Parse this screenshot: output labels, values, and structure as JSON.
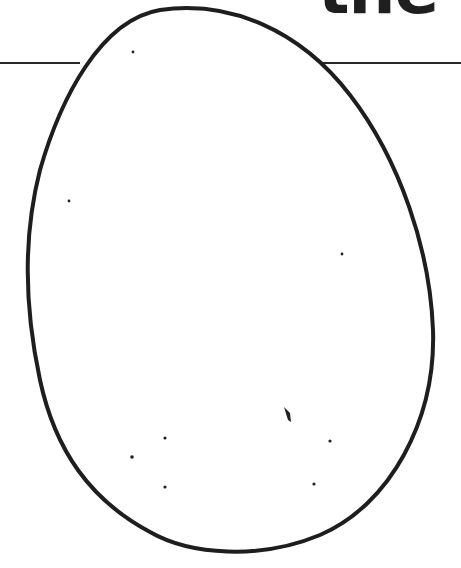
{
  "page": {
    "title_fragment": "the ’"
  },
  "illustration": {
    "subject": "egg-outline-coloring-page",
    "stroke_color": "#1e1e1e",
    "fill_color": "#ffffff",
    "speckles": [
      {
        "x": 133,
        "y": 52
      },
      {
        "x": 69,
        "y": 201
      },
      {
        "x": 342,
        "y": 254
      },
      {
        "x": 165,
        "y": 438
      },
      {
        "x": 132,
        "y": 457
      },
      {
        "x": 165,
        "y": 487
      },
      {
        "x": 330,
        "y": 441
      },
      {
        "x": 314,
        "y": 484
      }
    ]
  }
}
